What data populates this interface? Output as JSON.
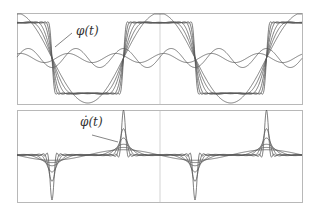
{
  "chart_data": [
    {
      "type": "line",
      "title": "",
      "annotation": "φ(t)",
      "description": "Partial Fourier-type approximations of a periodic square wave; successive curves sharpen toward the ideal square wave",
      "xlabel": "",
      "ylabel": "",
      "grid": false,
      "center_line": true,
      "period_px": 143,
      "crossings_x_px": [
        52,
        123,
        196,
        267
      ],
      "levels": {
        "high": 1,
        "low": -1
      },
      "series": [
        {
          "name": "approx-1",
          "harmonics": 1
        },
        {
          "name": "approx-2",
          "harmonics": 2
        },
        {
          "name": "approx-3",
          "harmonics": 3
        },
        {
          "name": "approx-4",
          "harmonics": 5
        },
        {
          "name": "approx-5",
          "harmonics": 8
        },
        {
          "name": "approx-6",
          "harmonics": 14
        }
      ]
    },
    {
      "type": "line",
      "title": "",
      "annotation": "φ̇(t)",
      "description": "Time derivatives of the approximations above; spikes at the square-wave transitions",
      "xlabel": "",
      "ylabel": "",
      "grid": false,
      "center_line": true,
      "spikes_x_px": [
        53,
        124,
        196,
        267
      ],
      "spike_signs": [
        -1,
        1,
        -1,
        1
      ],
      "series": [
        {
          "name": "deriv-1",
          "harmonics": 1
        },
        {
          "name": "deriv-2",
          "harmonics": 2
        },
        {
          "name": "deriv-3",
          "harmonics": 3
        },
        {
          "name": "deriv-4",
          "harmonics": 5
        },
        {
          "name": "deriv-5",
          "harmonics": 8
        },
        {
          "name": "deriv-6",
          "harmonics": 14
        }
      ]
    }
  ],
  "labels": {
    "top": "φ(t)",
    "bottom": "φ̇(t)"
  },
  "colors": {
    "line": "#555555",
    "frame": "#b8b8b8",
    "center": "#c8c8c8"
  }
}
